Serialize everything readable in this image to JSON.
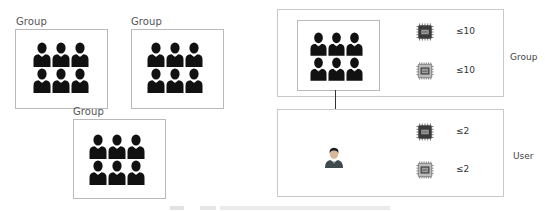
{
  "left_groups": [
    {
      "label": "Group",
      "members": 6
    },
    {
      "label": "Group",
      "members": 6
    },
    {
      "label": "Group",
      "members": 6
    }
  ],
  "right_panels": {
    "group": {
      "label": "Group",
      "icon": "group-of-people-icon",
      "resources": [
        {
          "icon": "cpu-chip-icon",
          "limit": "≤10"
        },
        {
          "icon": "gpu-chip-icon",
          "limit": "≤10"
        }
      ]
    },
    "user": {
      "label": "User",
      "icon": "user-avatar-icon",
      "resources": [
        {
          "icon": "cpu-chip-icon",
          "limit": "≤2"
        },
        {
          "icon": "gpu-chip-icon",
          "limit": "≤2"
        }
      ]
    }
  },
  "colors": {
    "people_fill": "#111111",
    "box_border": "#b9b9b9",
    "chip_dark": "#3a3a3a",
    "chip_light": "#8a8a8a"
  }
}
